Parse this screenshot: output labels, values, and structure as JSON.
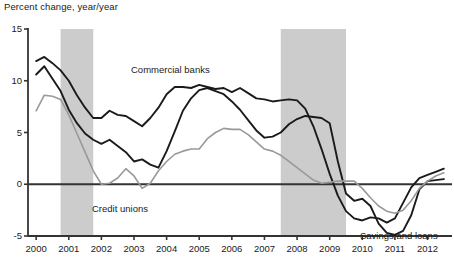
{
  "chart_data": {
    "type": "line",
    "title": "",
    "ylabel": "Percent change, year/year",
    "xlabel": "",
    "ylim": [
      -5,
      15
    ],
    "xlim": [
      1999.75,
      2012.75
    ],
    "grid": false,
    "legend": "inline-annotations",
    "yticks": [
      "15",
      "10",
      "5",
      "0",
      "-5"
    ],
    "ytick_values": [
      15,
      10,
      5,
      0,
      -5
    ],
    "xticks": [
      "2000",
      "2001",
      "2002",
      "2003",
      "2004",
      "2005",
      "2006",
      "2007",
      "2008",
      "2009",
      "2010",
      "2011",
      "2012"
    ],
    "xtick_values": [
      2000,
      2001,
      2002,
      2003,
      2004,
      2005,
      2006,
      2007,
      2008,
      2009,
      2010,
      2011,
      2012
    ],
    "zero_line": 0,
    "shaded_regions": [
      {
        "name": "recession-2001",
        "x0": 2000.75,
        "x1": 2001.75
      },
      {
        "name": "recession-2008",
        "x0": 2007.5,
        "x1": 2009.5
      }
    ],
    "series": [
      {
        "name": "Commercial banks",
        "color": "#1a1a1a",
        "annotation": "Commercial banks",
        "x": [
          2000.0,
          2000.25,
          2000.5,
          2000.75,
          2001.0,
          2001.25,
          2001.5,
          2001.75,
          2002.0,
          2002.25,
          2002.5,
          2002.75,
          2003.0,
          2003.25,
          2003.5,
          2003.75,
          2004.0,
          2004.25,
          2004.5,
          2004.75,
          2005.0,
          2005.25,
          2005.5,
          2005.75,
          2006.0,
          2006.25,
          2006.5,
          2006.75,
          2007.0,
          2007.25,
          2007.5,
          2007.75,
          2008.0,
          2008.25,
          2008.5,
          2008.75,
          2009.0,
          2009.25,
          2009.5,
          2009.75,
          2010.0,
          2010.25,
          2010.5,
          2010.75,
          2011.0,
          2011.25,
          2011.5,
          2011.75,
          2012.0,
          2012.25,
          2012.5
        ],
        "y": [
          11.9,
          12.3,
          11.7,
          11.0,
          10.0,
          8.6,
          7.4,
          6.4,
          6.4,
          7.1,
          6.7,
          6.6,
          6.1,
          5.6,
          6.4,
          7.4,
          8.7,
          9.4,
          9.4,
          9.3,
          9.6,
          9.4,
          9.2,
          9.3,
          8.9,
          9.3,
          8.8,
          8.3,
          8.2,
          8.0,
          8.1,
          8.2,
          8.1,
          7.3,
          5.6,
          3.4,
          1.0,
          -1.1,
          -2.6,
          -3.3,
          -3.5,
          -3.2,
          -3.3,
          -3.7,
          -3.3,
          -1.8,
          -0.3,
          0.6,
          0.9,
          1.2,
          1.5
        ]
      },
      {
        "name": "Savings and loans",
        "color": "#1a1a1a",
        "annotation": "Savings and loans",
        "x": [
          2000.0,
          2000.25,
          2000.5,
          2000.75,
          2001.0,
          2001.25,
          2001.5,
          2001.75,
          2002.0,
          2002.25,
          2002.5,
          2002.75,
          2003.0,
          2003.25,
          2003.5,
          2003.75,
          2004.0,
          2004.25,
          2004.5,
          2004.75,
          2005.0,
          2005.25,
          2005.5,
          2005.75,
          2006.0,
          2006.25,
          2006.5,
          2006.75,
          2007.0,
          2007.25,
          2007.5,
          2007.75,
          2008.0,
          2008.25,
          2008.5,
          2008.75,
          2009.0,
          2009.25,
          2009.5,
          2009.75,
          2010.0,
          2010.25,
          2010.5,
          2010.75,
          2011.0,
          2011.25,
          2011.5,
          2011.75,
          2012.0,
          2012.25,
          2012.5
        ],
        "y": [
          10.6,
          11.4,
          10.2,
          9.0,
          7.2,
          5.9,
          4.9,
          4.3,
          3.9,
          4.3,
          3.7,
          3.1,
          2.2,
          2.4,
          1.9,
          1.6,
          3.2,
          5.1,
          7.1,
          8.3,
          9.1,
          9.3,
          9.0,
          8.7,
          8.0,
          7.2,
          6.2,
          5.2,
          4.5,
          4.6,
          5.0,
          5.8,
          6.3,
          6.6,
          6.5,
          6.4,
          5.9,
          2.2,
          -0.9,
          -1.6,
          -1.4,
          -2.1,
          -3.8,
          -4.7,
          -4.9,
          -4.5,
          -3.0,
          -0.5,
          0.3,
          0.4,
          0.5
        ]
      },
      {
        "name": "Credit unions",
        "color": "#999999",
        "annotation": "Credit unions",
        "x": [
          2000.0,
          2000.25,
          2000.5,
          2000.75,
          2001.0,
          2001.25,
          2001.5,
          2001.75,
          2002.0,
          2002.25,
          2002.5,
          2002.75,
          2003.0,
          2003.25,
          2003.5,
          2003.75,
          2004.0,
          2004.25,
          2004.5,
          2004.75,
          2005.0,
          2005.25,
          2005.5,
          2005.75,
          2006.0,
          2006.25,
          2006.5,
          2006.75,
          2007.0,
          2007.25,
          2007.5,
          2007.75,
          2008.0,
          2008.25,
          2008.5,
          2008.75,
          2009.0,
          2009.25,
          2009.5,
          2009.75,
          2010.0,
          2010.25,
          2010.5,
          2010.75,
          2011.0,
          2011.25,
          2011.5,
          2011.75,
          2012.0,
          2012.25,
          2012.5
        ],
        "y": [
          7.1,
          8.6,
          8.5,
          8.2,
          6.7,
          4.9,
          3.1,
          1.3,
          0.0,
          0.1,
          0.6,
          1.5,
          0.8,
          -0.4,
          0.1,
          1.3,
          2.2,
          2.9,
          3.2,
          3.4,
          3.4,
          4.4,
          5.0,
          5.4,
          5.3,
          5.3,
          4.8,
          4.1,
          3.4,
          3.2,
          2.8,
          2.2,
          1.6,
          1.0,
          0.4,
          0.1,
          0.2,
          0.3,
          0.3,
          0.3,
          -0.4,
          -1.3,
          -2.1,
          -2.6,
          -2.8,
          -2.5,
          -1.6,
          -0.4,
          0.3,
          0.8,
          1.1
        ]
      }
    ]
  }
}
